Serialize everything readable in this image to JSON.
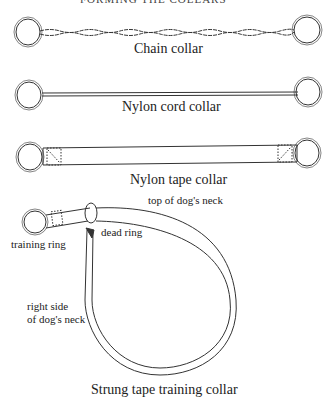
{
  "figure": {
    "header": "FORMING THE COLLARS",
    "collars": [
      {
        "id": "chain",
        "caption": "Chain collar"
      },
      {
        "id": "nylon-cord",
        "caption": "Nylon cord collar"
      },
      {
        "id": "nylon-tape",
        "caption": "Nylon tape collar"
      },
      {
        "id": "strung-tape",
        "caption": "Strung tape training collar"
      }
    ],
    "annotations": {
      "top_of_neck": "top of dog's neck",
      "training_ring": "training ring",
      "dead_ring": "dead ring",
      "right_side_line1": "right side",
      "right_side_line2": "of dog's neck"
    }
  }
}
